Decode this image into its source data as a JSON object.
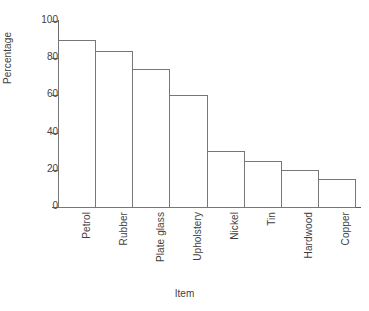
{
  "chart_data": {
    "type": "bar",
    "title": "",
    "subtitle": "",
    "xlabel": "Item",
    "ylabel": "Percentage",
    "categories": [
      "Petrol",
      "Rubber",
      "Plate glass",
      "Upholstery",
      "Nickel",
      "Tin",
      "Hardwood",
      "Copper"
    ],
    "values": [
      90,
      84,
      74,
      60,
      30,
      25,
      20,
      15
    ],
    "ylim": [
      0,
      100
    ],
    "yticks": [
      0,
      20,
      40,
      60,
      80,
      100
    ],
    "ytick_labels": [
      "0",
      "20",
      "40",
      "60",
      "80",
      "100"
    ],
    "grid": false,
    "legend": null,
    "bar_style": {
      "fill": "#ffffff",
      "edge": "#777777",
      "adjacent": true
    },
    "axis_color": "#6b6b6b",
    "text_color": "#3f3f3f",
    "background": "#ffffff",
    "xtick_label_rotation": 90
  }
}
